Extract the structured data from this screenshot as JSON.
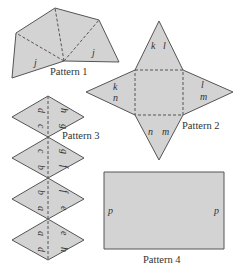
{
  "figure": {
    "patterns": [
      {
        "id": "pattern1",
        "caption": "Pattern 1",
        "edge_labels": [
          "j",
          "j"
        ],
        "description": "Fan of four triangles sharing a common vertex, joined by dashed fold lines"
      },
      {
        "id": "pattern2",
        "caption": "Pattern 2",
        "edge_labels": {
          "top_triangle": [
            "k",
            "l"
          ],
          "left_triangle": [
            "k",
            "n"
          ],
          "right_triangle": [
            "l",
            "m"
          ],
          "bottom_triangle": [
            "n",
            "m"
          ]
        },
        "description": "Square base with four triangles (square pyramid net), dashed fold lines"
      },
      {
        "id": "pattern3",
        "caption": "Pattern 3",
        "diamonds": [
          {
            "left_top": "d",
            "left_bottom": "c",
            "right_top": "h",
            "right_bottom": "g"
          },
          {
            "left_top": "c",
            "left_bottom": "b",
            "right_top": "g",
            "right_bottom": "f"
          },
          {
            "left_top": "b",
            "left_bottom": "a",
            "right_top": "f",
            "right_bottom": "e"
          },
          {
            "left_top": "a",
            "left_bottom": "d",
            "right_top": "e",
            "right_bottom": "h"
          }
        ],
        "description": "Four stacked rhombi split by a vertical dashed line, edge labels rotated"
      },
      {
        "id": "pattern4",
        "caption": "Pattern 4",
        "edge_labels": [
          "p",
          "p"
        ],
        "description": "Rectangle with matching left and right edges labeled p"
      }
    ],
    "colors": {
      "face": "#d3d3d3",
      "stroke": "#555555",
      "text": "#333333"
    }
  }
}
